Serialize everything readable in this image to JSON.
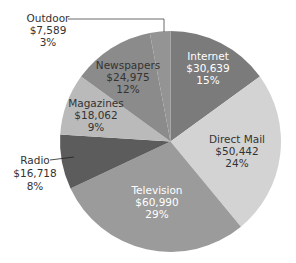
{
  "chart_data": {
    "type": "pie",
    "title": "",
    "start_angle": "12 o'clock",
    "direction": "clockwise",
    "slices": [
      {
        "label": "Internet",
        "value": 30639,
        "value_label": "$30,639",
        "percent": 15,
        "percent_label": "15%",
        "color": "#7b7b7b",
        "text_color": "#ffffff"
      },
      {
        "label": "Direct Mail",
        "value": 50442,
        "value_label": "$50,442",
        "percent": 24,
        "percent_label": "24%",
        "color": "#d3d3d3",
        "text_color": "#333333"
      },
      {
        "label": "Television",
        "value": 60990,
        "value_label": "$60,990",
        "percent": 29,
        "percent_label": "29%",
        "color": "#9b9b9b",
        "text_color": "#ffffff"
      },
      {
        "label": "Radio",
        "value": 16718,
        "value_label": "$16,718",
        "percent": 8,
        "percent_label": "8%",
        "color": "#5c5c5c",
        "text_color": "#333333"
      },
      {
        "label": "Magazines",
        "value": 18062,
        "value_label": "$18,062",
        "percent": 9,
        "percent_label": "9%",
        "color": "#bababa",
        "text_color": "#333333"
      },
      {
        "label": "Newspapers",
        "value": 24975,
        "value_label": "$24,975",
        "percent": 12,
        "percent_label": "12%",
        "color": "#8b8b8b",
        "text_color": "#333333"
      },
      {
        "label": "Outdoor",
        "value": 7589,
        "value_label": "$7,589",
        "percent": 3,
        "percent_label": "3%",
        "color": "#949494",
        "text_color": "#333333"
      }
    ],
    "legend": "none (labels on slices)",
    "grid": false
  }
}
